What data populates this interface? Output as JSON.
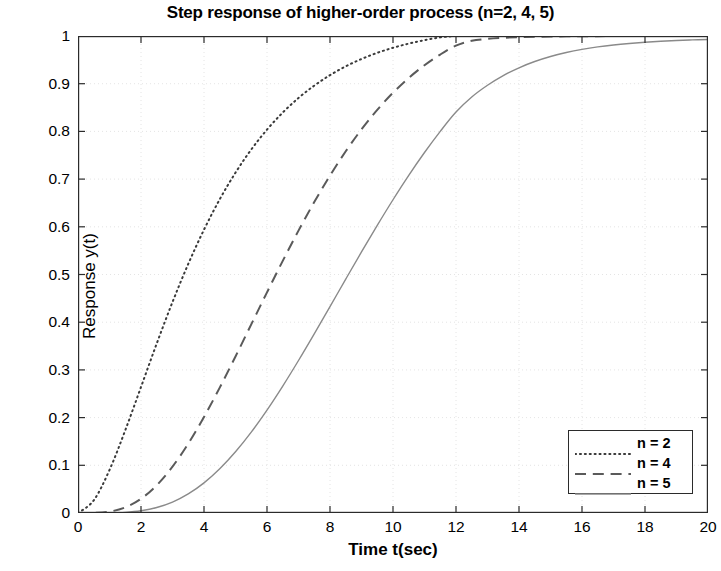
{
  "chart_data": {
    "type": "line",
    "title": "Step response of higher-order process (n=2, 4, 5)",
    "xlabel": "Time t(sec)",
    "ylabel": "Response y(t)",
    "xlim": [
      0,
      20
    ],
    "ylim": [
      0,
      1
    ],
    "grid": true,
    "grid_style": "faint dotted",
    "legend_position": "lower right",
    "background_color": "#ffffff",
    "axis_color": "#2b2b2b",
    "x_ticks": [
      0,
      2,
      4,
      6,
      8,
      10,
      12,
      14,
      16,
      18,
      20
    ],
    "x_tick_labels": [
      "0",
      "2",
      "4",
      "6",
      "8",
      "10",
      "12",
      "14",
      "16",
      "18",
      "20"
    ],
    "y_ticks": [
      0,
      0.1,
      0.2,
      0.3,
      0.4,
      0.5,
      0.6,
      0.7,
      0.8,
      0.9,
      1
    ],
    "y_tick_labels": [
      "0",
      "0.1",
      "0.2",
      "0.3",
      "0.4",
      "0.5",
      "0.6",
      "0.7",
      "0.8",
      "0.9",
      "1"
    ],
    "x": [
      0,
      0.5,
      1,
      1.5,
      2,
      2.5,
      3,
      3.5,
      4,
      4.5,
      5,
      5.5,
      6,
      6.5,
      7,
      7.5,
      8,
      8.5,
      9,
      9.5,
      10,
      10.5,
      11,
      11.5,
      12,
      12.5,
      13,
      13.5,
      14,
      14.5,
      15,
      15.5,
      16,
      16.5,
      17,
      17.5,
      18,
      18.5,
      19,
      19.5,
      20
    ],
    "series": [
      {
        "name": "n = 2",
        "label": "n = 2",
        "order": 2,
        "tau": 2.0,
        "style": "dotted",
        "color": "#3a3a3a",
        "width": 2.0,
        "values": [
          0,
          0.0265,
          0.0902,
          0.1734,
          0.2642,
          0.3554,
          0.4422,
          0.5221,
          0.594,
          0.6577,
          0.7135,
          0.7619,
          0.8037,
          0.8395,
          0.8701,
          0.896,
          0.9179,
          0.9364,
          0.9518,
          0.9647,
          0.9753,
          0.9841,
          0.9913,
          0.9971,
          1.0,
          1.0,
          1.0,
          1.0,
          1.0,
          1.0,
          1.0,
          1.0,
          1.0,
          1.0,
          1.0,
          1.0,
          1.0,
          1.0,
          1.0,
          1.0,
          1.0
        ]
      },
      {
        "name": "n = 4",
        "label": "n = 4",
        "order": 4,
        "tau": 1.75,
        "style": "dashed",
        "color": "#5a5a5a",
        "width": 2.0,
        "values": [
          0,
          0.0002,
          0.0029,
          0.0118,
          0.0298,
          0.0583,
          0.0972,
          0.1454,
          0.2013,
          0.2629,
          0.3282,
          0.3954,
          0.4626,
          0.5286,
          0.592,
          0.6518,
          0.7074,
          0.7583,
          0.8042,
          0.8451,
          0.881,
          0.9121,
          0.9387,
          0.9611,
          0.9797,
          0.99,
          0.994,
          0.9962,
          0.9975,
          0.9983,
          0.9989,
          0.9993,
          0.9995,
          0.9997,
          0.9998,
          0.9999,
          0.9999,
          1.0,
          1.0,
          1.0,
          1.0
        ]
      },
      {
        "name": "n = 5",
        "label": "n = 5",
        "order": 5,
        "tau": 1.72,
        "style": "solid",
        "color": "#8a8a8a",
        "width": 1.4,
        "values": [
          0,
          0.0,
          0.0002,
          0.0014,
          0.0047,
          0.0115,
          0.0229,
          0.04,
          0.0632,
          0.0927,
          0.1283,
          0.1695,
          0.2157,
          0.2661,
          0.3197,
          0.3756,
          0.4328,
          0.4903,
          0.5473,
          0.603,
          0.6567,
          0.7078,
          0.7557,
          0.8001,
          0.8406,
          0.8722,
          0.8968,
          0.917,
          0.9334,
          0.9465,
          0.957,
          0.9653,
          0.9719,
          0.9771,
          0.9812,
          0.9844,
          0.987,
          0.989,
          0.9906,
          0.9918,
          0.9928
        ]
      }
    ]
  },
  "legend": {
    "items": [
      {
        "label": "n = 2",
        "sample": "dotted-line-sample"
      },
      {
        "label": "n = 4",
        "sample": "dashed-line-sample"
      },
      {
        "label": "n = 5",
        "sample": "solid-line-sample"
      }
    ]
  }
}
